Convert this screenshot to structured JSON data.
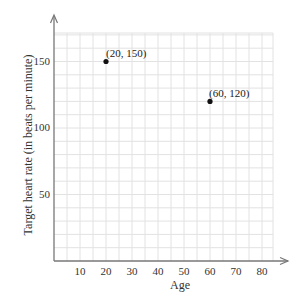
{
  "chart_data": {
    "type": "scatter",
    "title": "",
    "xlabel": "Age",
    "ylabel": "Target heart rate (in beats per minute)",
    "xlim": [
      0,
      85
    ],
    "ylim": [
      0,
      170
    ],
    "grid": true,
    "x_ticks": [
      "10",
      "20",
      "30",
      "40",
      "50",
      "60",
      "70",
      "80"
    ],
    "y_ticks": [
      "50",
      "100",
      "150"
    ],
    "series": [
      {
        "name": "points",
        "x": [
          20,
          60
        ],
        "y": [
          150,
          120
        ]
      }
    ],
    "annotations": [
      "(20, 150)",
      "(60, 120)"
    ]
  },
  "colors": {
    "axis": "#777777",
    "grid": "#e2e2e2",
    "point": "#111111"
  }
}
